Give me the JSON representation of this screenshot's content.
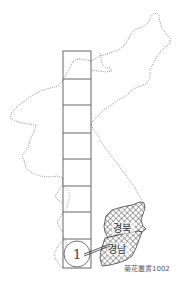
{
  "map": {
    "title": "Korean peninsula stamp sheet layout",
    "column": {
      "rows": 8,
      "highlighted_number": "1"
    },
    "regions": [
      {
        "id": "gyeongbuk",
        "label": "경북"
      },
      {
        "id": "gyeongnam",
        "label": "경남"
      }
    ],
    "caption": "菊花叢書1002",
    "colors": {
      "outline": "#777777",
      "column_stroke": "#666666",
      "hatch": "#555555",
      "background": "#ffffff"
    }
  }
}
